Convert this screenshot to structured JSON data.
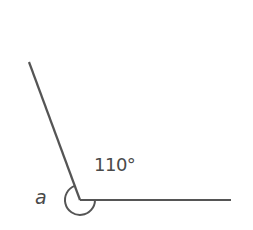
{
  "diagram": {
    "type": "angle",
    "colors": {
      "stroke": "#555555",
      "text": "#4a4a4a",
      "background": "#ffffff"
    },
    "vertex": {
      "x": 80,
      "y": 200
    },
    "rays": [
      {
        "name": "slanted-ray",
        "x1": 80,
        "y1": 200,
        "x2": 29,
        "y2": 62
      },
      {
        "name": "horizontal-ray",
        "x1": 80,
        "y1": 200,
        "x2": 231,
        "y2": 200
      }
    ],
    "labels": {
      "given_angle": "110°",
      "unknown_angle": "a"
    },
    "arc": {
      "marks": "reflex angle a",
      "radius": 15
    }
  }
}
